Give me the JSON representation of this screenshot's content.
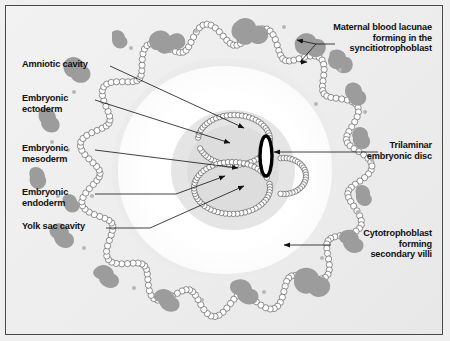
{
  "figure": {
    "background_color": "#efefef",
    "frame_color": "#4a4a4a",
    "ink_color": "#111111",
    "blob_color": "#9a9a9a",
    "halo_color": "#e0e0e0",
    "cavity_color": "#ffffff"
  },
  "labels": {
    "amniotic_cavity": "Amniotic cavity",
    "embryonic_ectoderm": "Embryonic\nectoderm",
    "embryonic_mesoderm": "Embryonic\nmesoderm",
    "embryonic_endoderm": "Embryonic\nendoderm",
    "yolk_sac_cavity": "Yolk sac cavity",
    "maternal_blood_lacunae": "Maternal blood lacunae\nforming in the\nsyncitiotrophoblast",
    "trilaminar_disc": "Trilaminar\nembryonic disc",
    "cytotrophoblast_villi": "Cytotrophoblast\nforming\nsecondary villi"
  },
  "structures": {
    "outer_ring": "syncitiotrophoblast-cytotrophoblast ring",
    "chorionic_cavity": "chorionic cavity",
    "amniotic_cavity": "amniotic cavity",
    "yolk_sac_cavity": "yolk sac cavity",
    "embryonic_disc": "trilaminar embryonic disc"
  }
}
